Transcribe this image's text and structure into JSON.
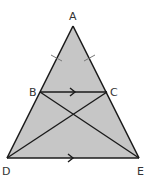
{
  "diagram": {
    "type": "geometry",
    "fill_color": "#c6c6c6",
    "line_color": "#1a1a1a",
    "tick_color": "#777777",
    "points": {
      "A": {
        "label": "A",
        "x": 73,
        "y": 26
      },
      "B": {
        "label": "B",
        "x": 40,
        "y": 92
      },
      "C": {
        "label": "C",
        "x": 107,
        "y": 92
      },
      "D": {
        "label": "D",
        "x": 7,
        "y": 158
      },
      "E": {
        "label": "E",
        "x": 139,
        "y": 158
      }
    },
    "segments": [
      "AD",
      "AE",
      "BC",
      "DE",
      "BE",
      "CD"
    ],
    "parallel_marks": [
      "BC",
      "DE"
    ],
    "equal_length_ticks": [
      "AB",
      "AC"
    ]
  }
}
